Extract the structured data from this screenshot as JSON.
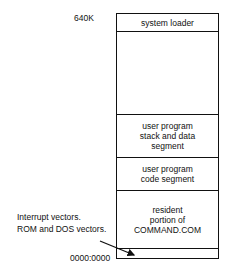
{
  "diagram": {
    "top_address": "640K",
    "bottom_address": "0000:0000",
    "segments": [
      {
        "label": "system loader"
      },
      {
        "label": ""
      },
      {
        "label": "user program\nstack and data\nsegment"
      },
      {
        "label": "user program\ncode segment"
      },
      {
        "label": "resident\nportion of\nCOMMAND.COM"
      },
      {
        "label": ""
      }
    ],
    "annotation": {
      "line1": "Interrupt vectors.",
      "line2": "ROM and DOS vectors."
    }
  }
}
